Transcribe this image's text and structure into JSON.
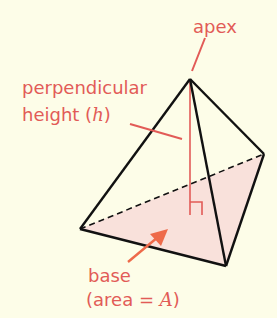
{
  "diagram": {
    "labels": {
      "apex": "apex",
      "height_line1": "perpendicular",
      "height_line2_prefix": "height (",
      "height_var": "h",
      "height_line2_suffix": ")",
      "base_line1": "base",
      "base_line2_prefix": "(area = ",
      "base_var": "A",
      "base_line2_suffix": ")"
    },
    "colors": {
      "background": "#fdfde8",
      "label": "#e25b57",
      "edge": "#111111",
      "height_line": "#e25b57",
      "base_fill": "#f8dcd8",
      "arrow": "#ee6a4a"
    },
    "vertices": {
      "apex": [
        190,
        79
      ],
      "left": [
        80,
        229
      ],
      "right": [
        264,
        154
      ],
      "bottom": [
        226,
        266
      ],
      "foot": [
        190,
        215
      ]
    }
  }
}
